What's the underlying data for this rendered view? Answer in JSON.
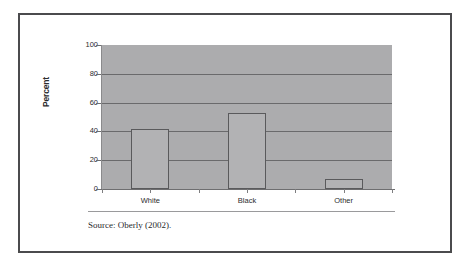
{
  "figure": {
    "source_note": "Source: Oberly (2002).",
    "frame_color": "#4b4b4d",
    "panel_color": "#acacae",
    "bar_fill_color": "#b2b2b4",
    "bar_border_color": "#5a5a5c",
    "gridline_color": "#6a6a6c"
  },
  "chart_data": {
    "type": "bar",
    "title": "",
    "subtitle": "",
    "xlabel": "",
    "ylabel": "Percent",
    "categories": [
      "White",
      "Black",
      "Other"
    ],
    "values": [
      42,
      53,
      7
    ],
    "ylim": [
      0,
      100
    ],
    "ytick_labels": [
      "100",
      "80",
      "60",
      "40",
      "20",
      "0"
    ],
    "ytick_values": [
      100,
      80,
      60,
      40,
      20,
      0
    ],
    "grid": true,
    "grid_axis": "y",
    "legend": false,
    "legend_position": "none"
  }
}
